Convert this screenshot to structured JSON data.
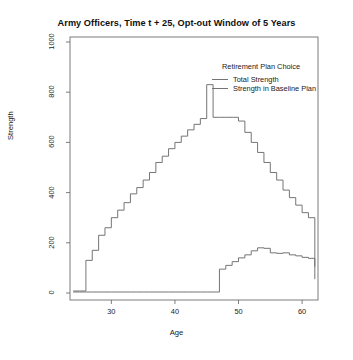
{
  "chart_data": {
    "type": "line",
    "subtype": "step",
    "title": "Army Officers, Time t + 25, Opt-out Window of 5 Years",
    "xlabel": "Age",
    "ylabel": "Strength",
    "xlim": [
      23.5,
      62.5
    ],
    "ylim": [
      0,
      1000
    ],
    "xticks": [
      30,
      40,
      50,
      60
    ],
    "yticks": [
      0,
      200,
      400,
      600,
      800,
      1000
    ],
    "grid": false,
    "legend_position": "top-right-inside",
    "legend_title": "Retirement Plan Choice",
    "line_color": "#6e6e6e",
    "x": [
      24,
      25,
      26,
      27,
      28,
      29,
      30,
      31,
      32,
      33,
      34,
      35,
      36,
      37,
      38,
      39,
      40,
      41,
      42,
      43,
      44,
      45,
      46,
      47,
      48,
      49,
      50,
      51,
      52,
      53,
      54,
      55,
      56,
      57,
      58,
      59,
      60,
      61,
      62
    ],
    "series": [
      {
        "name": "Total Strength",
        "values": [
          8,
          8,
          130,
          170,
          230,
          260,
          300,
          330,
          360,
          395,
          420,
          450,
          480,
          520,
          545,
          575,
          600,
          625,
          650,
          672,
          695,
          830,
          700,
          700,
          700,
          700,
          685,
          640,
          600,
          560,
          520,
          480,
          450,
          410,
          380,
          350,
          320,
          300,
          105
        ]
      },
      {
        "name": "Strength in Baseline Plan",
        "values": [
          4,
          4,
          4,
          4,
          4,
          4,
          4,
          4,
          4,
          4,
          4,
          4,
          4,
          4,
          4,
          4,
          4,
          4,
          4,
          4,
          4,
          4,
          4,
          95,
          110,
          125,
          140,
          152,
          168,
          180,
          178,
          160,
          158,
          160,
          152,
          148,
          142,
          138,
          55
        ]
      }
    ]
  },
  "legend": {
    "title": "Retirement Plan Choice",
    "entries": [
      {
        "label": "Total Strength"
      },
      {
        "label": "Strength in Baseline Plan"
      }
    ]
  }
}
